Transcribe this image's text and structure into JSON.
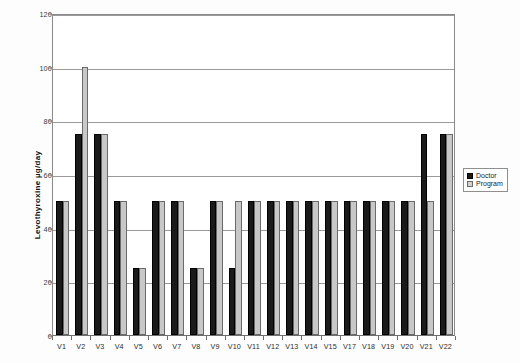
{
  "chart_data": {
    "type": "bar",
    "title": "",
    "xlabel": "",
    "ylabel": "Levothyroxine µg/day",
    "ylim": [
      0,
      120
    ],
    "ytick_labels": [
      "0",
      "20",
      "40",
      "60",
      "80",
      "100",
      "120"
    ],
    "ytick_values": [
      0,
      20,
      40,
      60,
      80,
      100,
      120
    ],
    "grid": true,
    "legend_position": "right-outside",
    "categories": [
      "V1",
      "V2",
      "V3",
      "V4",
      "V5",
      "V6",
      "V7",
      "V8",
      "V9",
      "V10",
      "V11",
      "V12",
      "V13",
      "V14",
      "V15",
      "V17",
      "V18",
      "V19",
      "V20",
      "V21",
      "V22"
    ],
    "series": [
      {
        "name": "Doctor",
        "color": "#1a1a1a",
        "values": [
          50,
          75,
          75,
          50,
          25,
          50,
          50,
          25,
          50,
          25,
          50,
          50,
          50,
          50,
          50,
          50,
          50,
          50,
          50,
          75,
          75
        ]
      },
      {
        "name": "Program",
        "color": "#c8c8c8",
        "values": [
          50,
          100,
          75,
          50,
          25,
          50,
          50,
          25,
          50,
          50,
          50,
          50,
          50,
          50,
          50,
          50,
          50,
          50,
          50,
          50,
          75
        ]
      }
    ]
  },
  "legend": {
    "items": [
      {
        "label": "Doctor",
        "swatch": "black-square-icon"
      },
      {
        "label": "Program",
        "swatch": "gray-square-icon"
      }
    ]
  }
}
